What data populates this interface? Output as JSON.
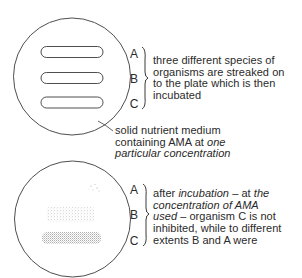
{
  "colors": {
    "ink": "#2a2a2a",
    "stipple": "#8a8a8a",
    "background": "#ffffff"
  },
  "plate_before": {
    "labels": [
      "A",
      "B",
      "C"
    ],
    "description": {
      "line1": "three different species of",
      "line2": "organisms are streaked on",
      "line3": "to the plate which is then",
      "line4": "incubated"
    },
    "medium_note": {
      "line1": "solid nutrient medium",
      "line2_pre": "containing AMA at ",
      "line2_it": "one",
      "line3_it": "particular concentration"
    }
  },
  "plate_after": {
    "labels": [
      "A",
      "B",
      "C"
    ],
    "description": {
      "line1_pre": "after ",
      "line1_it": "incubation",
      "line1_mid": " – at ",
      "line1_it2": "the",
      "line2_it": "concentration of AMA",
      "line3_it": "used",
      "line3_post": " – organism C is not",
      "line4": "inhibited, while to different",
      "line5": "extents B and A were"
    }
  }
}
